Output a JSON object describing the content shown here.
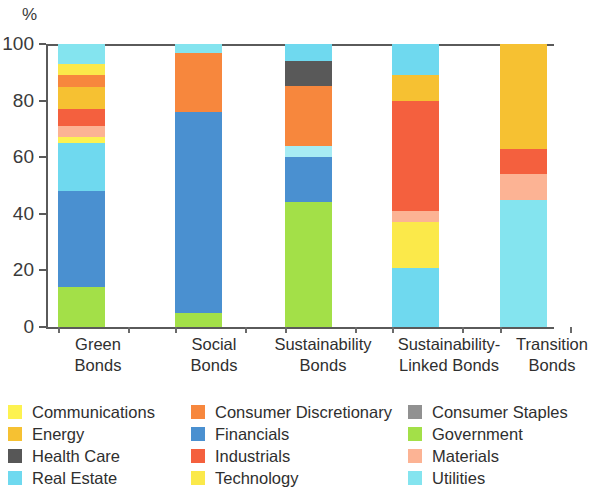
{
  "chart_data": {
    "type": "bar",
    "title": "",
    "subtitle": "",
    "xlabel": "",
    "ylabel": "%",
    "ylim": [
      0,
      100
    ],
    "yticks": [
      0,
      20,
      40,
      60,
      80,
      100
    ],
    "grid": false,
    "stacked": true,
    "stack_total": 100,
    "legend_position": "bottom",
    "legend_columns": 3,
    "categories": [
      "Green Bonds",
      "Social Bonds",
      "Sustainability Bonds",
      "Sustainability-Linked Bonds",
      "Transition Bonds"
    ],
    "category_lines": [
      [
        "Green",
        "Bonds"
      ],
      [
        "Social",
        "Bonds"
      ],
      [
        "Sustainability",
        "Bonds"
      ],
      [
        "Sustainability-",
        "Linked Bonds"
      ],
      [
        "Transition",
        "Bonds"
      ]
    ],
    "series": [
      {
        "name": "Communications",
        "color": "#fdf250",
        "values": [
          2,
          0,
          0,
          0,
          0
        ]
      },
      {
        "name": "Consumer Discretionary",
        "color": "#f7873d",
        "values": [
          4,
          21,
          21,
          0,
          0
        ]
      },
      {
        "name": "Consumer Staples",
        "color": "#919191",
        "values": [
          0,
          0,
          9,
          0,
          0
        ]
      },
      {
        "name": "Energy",
        "color": "#f6c132",
        "values": [
          8,
          0,
          0,
          9,
          37
        ]
      },
      {
        "name": "Financials",
        "color": "#4a90d0",
        "values": [
          34,
          71,
          16,
          0,
          0
        ]
      },
      {
        "name": "Government",
        "color": "#a3e048",
        "values": [
          14,
          5,
          44,
          0,
          0
        ]
      },
      {
        "name": "Health Care",
        "color": "#575757",
        "values": [
          0,
          0,
          0,
          0,
          0
        ]
      },
      {
        "name": "Industrials",
        "color": "#f4603e",
        "values": [
          6,
          0,
          0,
          39,
          9
        ]
      },
      {
        "name": "Materials",
        "color": "#fcb394",
        "values": [
          4,
          0,
          0,
          4,
          9
        ]
      },
      {
        "name": "Real Estate",
        "color": "#6fd9ef",
        "values": [
          19,
          0,
          0,
          21,
          45
        ]
      },
      {
        "name": "Technology",
        "color": "#fbe94a",
        "values": [
          4,
          0,
          0,
          16,
          0
        ]
      },
      {
        "name": "Utilities",
        "color": "#84e4ef",
        "values": [
          5,
          3,
          10,
          11,
          0
        ]
      }
    ],
    "stacks": [
      {
        "category": "Green Bonds",
        "segments": [
          {
            "name": "Government",
            "color": "#a3e048",
            "from": 0,
            "to": 14
          },
          {
            "name": "Financials",
            "color": "#4a90d0",
            "from": 14,
            "to": 48
          },
          {
            "name": "Real Estate",
            "color": "#6fd9ef",
            "from": 48,
            "to": 65
          },
          {
            "name": "Communications",
            "color": "#fdf250",
            "from": 65,
            "to": 67
          },
          {
            "name": "Materials",
            "color": "#fcb394",
            "from": 67,
            "to": 71
          },
          {
            "name": "Industrials",
            "color": "#f4603e",
            "from": 71,
            "to": 77
          },
          {
            "name": "Energy",
            "color": "#f6c132",
            "from": 77,
            "to": 85
          },
          {
            "name": "Consumer Discretionary",
            "color": "#f7873d",
            "from": 85,
            "to": 89
          },
          {
            "name": "Technology",
            "color": "#fbe94a",
            "from": 89,
            "to": 93
          },
          {
            "name": "Utilities",
            "color": "#84e4ef",
            "from": 93,
            "to": 100
          }
        ]
      },
      {
        "category": "Social Bonds",
        "segments": [
          {
            "name": "Government",
            "color": "#a3e048",
            "from": 0,
            "to": 5
          },
          {
            "name": "Financials",
            "color": "#4a90d0",
            "from": 5,
            "to": 76
          },
          {
            "name": "Consumer Discretionary",
            "color": "#f7873d",
            "from": 76,
            "to": 97
          },
          {
            "name": "Utilities",
            "color": "#84e4ef",
            "from": 97,
            "to": 100
          }
        ]
      },
      {
        "category": "Sustainability Bonds",
        "segments": [
          {
            "name": "Government",
            "color": "#a3e048",
            "from": 0,
            "to": 44
          },
          {
            "name": "Financials",
            "color": "#4a90d0",
            "from": 44,
            "to": 60
          },
          {
            "name": "Utilities",
            "color": "#a7ecf4",
            "from": 60,
            "to": 64
          },
          {
            "name": "Consumer Discretionary",
            "color": "#f7873d",
            "from": 64,
            "to": 85
          },
          {
            "name": "Consumer Staples",
            "color": "#595959",
            "from": 85,
            "to": 94
          },
          {
            "name": "Utilities",
            "color": "#6fd9ef",
            "from": 94,
            "to": 100
          }
        ]
      },
      {
        "category": "Sustainability-Linked Bonds",
        "segments": [
          {
            "name": "Real Estate",
            "color": "#6fd9ef",
            "from": 0,
            "to": 21
          },
          {
            "name": "Technology",
            "color": "#fbe94a",
            "from": 21,
            "to": 37
          },
          {
            "name": "Materials",
            "color": "#fcb394",
            "from": 37,
            "to": 41
          },
          {
            "name": "Industrials",
            "color": "#f4603e",
            "from": 41,
            "to": 80
          },
          {
            "name": "Energy",
            "color": "#f6c132",
            "from": 80,
            "to": 89
          },
          {
            "name": "Utilities",
            "color": "#6fd9ef",
            "from": 89,
            "to": 100
          }
        ]
      },
      {
        "category": "Transition Bonds",
        "segments": [
          {
            "name": "Real Estate",
            "color": "#84e4ef",
            "from": 0,
            "to": 45
          },
          {
            "name": "Materials",
            "color": "#fcb394",
            "from": 45,
            "to": 54
          },
          {
            "name": "Industrials",
            "color": "#f4603e",
            "from": 54,
            "to": 63
          },
          {
            "name": "Energy",
            "color": "#f6c132",
            "from": 63,
            "to": 100
          }
        ]
      }
    ],
    "legend": [
      {
        "label": "Communications",
        "color": "#fdf250"
      },
      {
        "label": "Consumer Discretionary",
        "color": "#f7873d"
      },
      {
        "label": "Consumer Staples",
        "color": "#919191"
      },
      {
        "label": "Energy",
        "color": "#f6c132"
      },
      {
        "label": "Financials",
        "color": "#4a90d0"
      },
      {
        "label": "Government",
        "color": "#a3e048"
      },
      {
        "label": "Health Care",
        "color": "#575757"
      },
      {
        "label": "Industrials",
        "color": "#f4603e"
      },
      {
        "label": "Materials",
        "color": "#fcb394"
      },
      {
        "label": "Real Estate",
        "color": "#6fd9ef"
      },
      {
        "label": "Technology",
        "color": "#fbe94a"
      },
      {
        "label": "Utilities",
        "color": "#84e4ef"
      }
    ]
  }
}
